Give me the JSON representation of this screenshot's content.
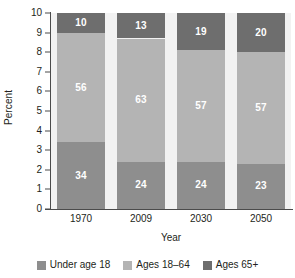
{
  "chart_data": {
    "type": "bar",
    "stacked": true,
    "title": "",
    "xlabel": "Year",
    "ylabel": "Percent",
    "categories": [
      "1970",
      "2009",
      "2030",
      "2050"
    ],
    "ylim": [
      0,
      10
    ],
    "yticks": [
      "0",
      "1",
      "2",
      "3",
      "4",
      "5",
      "6",
      "7",
      "8",
      "9",
      "10"
    ],
    "grid": false,
    "legend_position": "bottom",
    "note": "Each bar is scaled to the full 0-10 axis height; segment labels are percentages summing to 100.",
    "series": [
      {
        "name": "Under age 18",
        "color": "#8e8e8e",
        "values": [
          34,
          24,
          24,
          23
        ],
        "labels": [
          "34",
          "24",
          "24",
          "23"
        ]
      },
      {
        "name": "Ages 18–64",
        "color": "#b4b4b4",
        "values": [
          56,
          63,
          57,
          57
        ],
        "labels": [
          "56",
          "63",
          "57",
          "57"
        ]
      },
      {
        "name": "Ages 65+",
        "color": "#6e6e6e",
        "values": [
          10,
          13,
          19,
          20
        ],
        "labels": [
          "10",
          "13",
          "19",
          "20"
        ]
      }
    ]
  },
  "axes": {
    "y_title": "Percent",
    "x_title": "Year",
    "y_tick_labels": [
      "10",
      "9",
      "8",
      "7",
      "6",
      "5",
      "4",
      "3",
      "2",
      "1",
      "0"
    ],
    "x_tick_labels": [
      "1970",
      "2009",
      "2030",
      "2050"
    ]
  },
  "legend": {
    "items": [
      {
        "label": "Under age 18",
        "color": "#8e8e8e"
      },
      {
        "label": "Ages 18–64",
        "color": "#b4b4b4"
      },
      {
        "label": "Ages 65+",
        "color": "#6e6e6e"
      }
    ]
  },
  "colors": {
    "plot_background": "#f2f2f2",
    "page_background": "#ffffff",
    "axis": "#4b4b4b",
    "text": "#231f20",
    "label_text": "#ffffff"
  }
}
